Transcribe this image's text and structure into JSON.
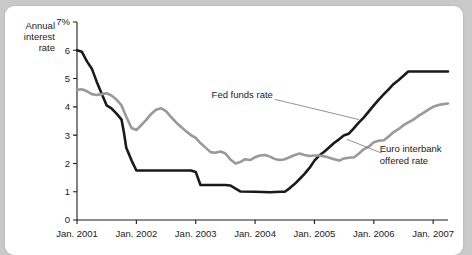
{
  "card": {
    "background": "#ffffff",
    "page_background": "#c9c9c9"
  },
  "chart_data": {
    "type": "line",
    "title": "",
    "subtitle": "",
    "ylabel": "Annual interest rate",
    "xlabel": "",
    "ylim": [
      0,
      7
    ],
    "xlim": [
      2001.0,
      2007.25
    ],
    "grid": false,
    "legend_position": "inline-annotations",
    "y_ticks": [
      "0",
      "1",
      "2",
      "3",
      "4",
      "5",
      "6",
      "7%"
    ],
    "y_tick_values": [
      0,
      1,
      2,
      3,
      4,
      5,
      6,
      7
    ],
    "y_top_label": "7%",
    "x_ticks": [
      "Jan. 2001",
      "Jan. 2002",
      "Jan. 2003",
      "Jan. 2004",
      "Jan. 2005",
      "Jan. 2006",
      "Jan. 2007"
    ],
    "x_tick_values": [
      2001,
      2002,
      2003,
      2004,
      2005,
      2006,
      2007
    ],
    "annotations": [
      {
        "name": "fed-funds-rate-label",
        "text": "Fed funds rate",
        "x": 2004.3,
        "y": 4.3,
        "leader_to_x": 2005.75,
        "leader_to_y": 3.55
      },
      {
        "name": "euro-interbank-offered-rate-label",
        "line1": "Euro interbank",
        "line2": "offered rate",
        "x": 2006.1,
        "y": 2.4,
        "leader_to_x": 2005.55,
        "leader_to_y": 2.85
      }
    ],
    "series": [
      {
        "name": "Fed funds rate",
        "color": "#1a1a1a",
        "width": 2.6,
        "x": [
          2001.0,
          2001.08,
          2001.17,
          2001.25,
          2001.33,
          2001.42,
          2001.5,
          2001.58,
          2001.67,
          2001.75,
          2001.79,
          2001.83,
          2001.92,
          2002.0,
          2002.25,
          2002.5,
          2002.75,
          2002.92,
          2003.0,
          2003.08,
          2003.25,
          2003.42,
          2003.5,
          2003.58,
          2003.75,
          2004.0,
          2004.25,
          2004.42,
          2004.5,
          2004.58,
          2004.67,
          2004.75,
          2004.83,
          2004.92,
          2005.0,
          2005.08,
          2005.17,
          2005.25,
          2005.33,
          2005.42,
          2005.5,
          2005.58,
          2005.67,
          2005.75,
          2005.83,
          2005.92,
          2006.0,
          2006.08,
          2006.17,
          2006.25,
          2006.33,
          2006.42,
          2006.5,
          2006.58,
          2006.75,
          2007.0,
          2007.25
        ],
        "values": [
          6.0,
          5.95,
          5.6,
          5.35,
          4.9,
          4.45,
          4.05,
          3.95,
          3.75,
          3.55,
          3.1,
          2.55,
          2.1,
          1.75,
          1.75,
          1.75,
          1.75,
          1.75,
          1.7,
          1.24,
          1.24,
          1.24,
          1.24,
          1.22,
          1.01,
          1.0,
          0.98,
          1.0,
          1.0,
          1.12,
          1.28,
          1.45,
          1.62,
          1.85,
          2.1,
          2.28,
          2.42,
          2.57,
          2.72,
          2.86,
          3.0,
          3.05,
          3.26,
          3.45,
          3.62,
          3.85,
          4.05,
          4.25,
          4.45,
          4.62,
          4.8,
          4.95,
          5.1,
          5.25,
          5.25,
          5.25,
          5.25
        ]
      },
      {
        "name": "Euro interbank offered rate",
        "color": "#999999",
        "width": 2.6,
        "x": [
          2001.0,
          2001.08,
          2001.17,
          2001.25,
          2001.33,
          2001.42,
          2001.5,
          2001.58,
          2001.67,
          2001.75,
          2001.83,
          2001.92,
          2002.0,
          2002.08,
          2002.17,
          2002.25,
          2002.33,
          2002.42,
          2002.5,
          2002.58,
          2002.67,
          2002.75,
          2002.83,
          2002.92,
          2003.0,
          2003.08,
          2003.17,
          2003.25,
          2003.33,
          2003.42,
          2003.5,
          2003.58,
          2003.67,
          2003.75,
          2003.83,
          2003.92,
          2004.0,
          2004.08,
          2004.17,
          2004.25,
          2004.33,
          2004.42,
          2004.5,
          2004.58,
          2004.67,
          2004.75,
          2004.83,
          2004.92,
          2005.0,
          2005.08,
          2005.17,
          2005.25,
          2005.33,
          2005.42,
          2005.5,
          2005.58,
          2005.67,
          2005.75,
          2005.83,
          2005.92,
          2006.0,
          2006.08,
          2006.17,
          2006.25,
          2006.33,
          2006.42,
          2006.5,
          2006.58,
          2006.67,
          2006.75,
          2006.83,
          2006.92,
          2007.0,
          2007.12,
          2007.25
        ],
        "values": [
          4.6,
          4.62,
          4.55,
          4.45,
          4.42,
          4.45,
          4.48,
          4.4,
          4.25,
          4.05,
          3.65,
          3.25,
          3.18,
          3.35,
          3.55,
          3.75,
          3.9,
          3.95,
          3.85,
          3.65,
          3.45,
          3.3,
          3.15,
          3.0,
          2.9,
          2.72,
          2.55,
          2.4,
          2.38,
          2.42,
          2.35,
          2.15,
          2.0,
          2.05,
          2.15,
          2.12,
          2.22,
          2.28,
          2.3,
          2.24,
          2.16,
          2.12,
          2.15,
          2.22,
          2.3,
          2.35,
          2.3,
          2.26,
          2.28,
          2.28,
          2.25,
          2.2,
          2.15,
          2.1,
          2.18,
          2.2,
          2.22,
          2.35,
          2.5,
          2.6,
          2.75,
          2.8,
          2.82,
          2.95,
          3.1,
          3.22,
          3.35,
          3.45,
          3.55,
          3.68,
          3.78,
          3.9,
          4.0,
          4.08,
          4.12
        ]
      }
    ]
  }
}
